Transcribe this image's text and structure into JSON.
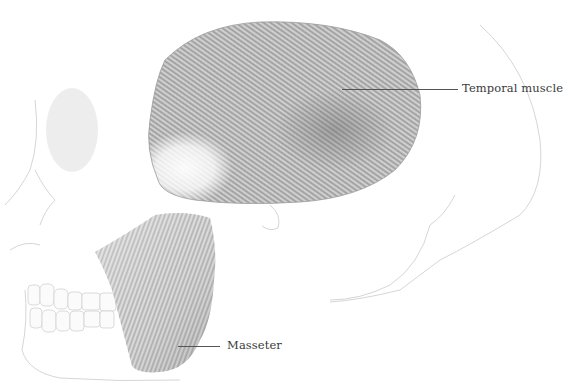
{
  "figure": {
    "labels": [
      {
        "id": "temporal",
        "text": "Temporal muscle"
      },
      {
        "id": "masseter",
        "text": "Masseter"
      }
    ]
  },
  "colors": {
    "background": "#ffffff",
    "muscle_shade": "#9a9a9a",
    "muscle_dark": "#7c7c7c",
    "bone_outline": "#d4d4d4",
    "label_text": "#3a3a3a",
    "leader_line": "#555555"
  }
}
